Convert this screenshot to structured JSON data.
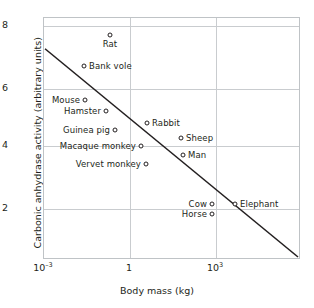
{
  "chart_data": {
    "type": "scatter",
    "title": "",
    "xlabel": "Body mass (kg)",
    "ylabel": "Carbonic anhydrase activity (arbitrary units)",
    "xscale": "log",
    "yscale": "linear",
    "xlim": [
      0.001,
      100000
    ],
    "ylim": [
      0.7,
      8.45
    ],
    "grid": true,
    "legend": "none",
    "xticks": [
      {
        "label_mantissa": "10",
        "label_exponent": "–3",
        "value": 0.001,
        "px": 0
      },
      {
        "label_mantissa": "1",
        "label_exponent": "",
        "value": 1,
        "px": 86
      },
      {
        "label_mantissa": "10",
        "label_exponent": "3",
        "value": 1000,
        "px": 172
      }
    ],
    "yticks": [
      {
        "label": "8",
        "value": 8,
        "px": 8
      },
      {
        "label": "6",
        "value": 6,
        "px": 71
      },
      {
        "label": "4",
        "value": 4,
        "px": 128
      },
      {
        "label": "2",
        "value": 2,
        "px": 191
      }
    ],
    "points": [
      {
        "label": "Rat",
        "x_px": 66,
        "y_px": 17,
        "label_side": "below",
        "mass_kg": 0.25,
        "activity": 7.9
      },
      {
        "label": "Bank vole",
        "x_px": 40,
        "y_px": 48,
        "label_side": "right",
        "mass_kg": 0.025,
        "activity": 6.8
      },
      {
        "label": "Mouse",
        "x_px": 41,
        "y_px": 82,
        "label_side": "left",
        "mass_kg": 0.03,
        "activity": 5.65
      },
      {
        "label": "Hamster",
        "x_px": 62,
        "y_px": 93,
        "label_side": "left",
        "mass_kg": 0.1,
        "activity": 5.2
      },
      {
        "label": "Guinea pig",
        "x_px": 71,
        "y_px": 112,
        "label_side": "left",
        "mass_kg": 0.6,
        "activity": 4.55
      },
      {
        "label": "Macaque monkey",
        "x_px": 97,
        "y_px": 128,
        "label_side": "left",
        "mass_kg": 4,
        "activity": 4.0
      },
      {
        "label": "Vervet monkey",
        "x_px": 102,
        "y_px": 146,
        "label_side": "left",
        "mass_kg": 6,
        "activity": 3.4
      },
      {
        "label": "Rabbit",
        "x_px": 103,
        "y_px": 105,
        "label_side": "right",
        "mass_kg": 2,
        "activity": 4.75
      },
      {
        "label": "Sheep",
        "x_px": 137,
        "y_px": 120,
        "label_side": "right",
        "mass_kg": 50,
        "activity": 4.35
      },
      {
        "label": "Man",
        "x_px": 139,
        "y_px": 137,
        "label_side": "right",
        "mass_kg": 60,
        "activity": 3.75
      },
      {
        "label": "Cow",
        "x_px": 168,
        "y_px": 186,
        "label_side": "left",
        "mass_kg": 600,
        "activity": 2.2
      },
      {
        "label": "Horse",
        "x_px": 168,
        "y_px": 196,
        "label_side": "left",
        "mass_kg": 500,
        "activity": 1.95
      },
      {
        "label": "Elephant",
        "x_px": 191,
        "y_px": 186,
        "label_side": "right",
        "mass_kg": 4000,
        "activity": 2.2
      }
    ],
    "trendline": {
      "x1_px": 1,
      "y1_px": 31,
      "x2_px": 256,
      "y2_px": 241,
      "description": "Fitted linear regression of activity against log body mass"
    }
  }
}
